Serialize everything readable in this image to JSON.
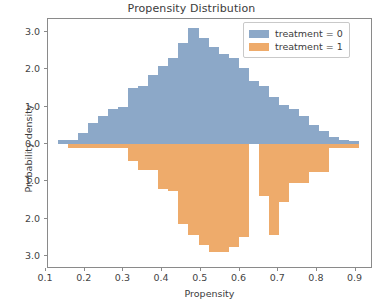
{
  "chart_data": {
    "type": "bar",
    "subtype": "mirrored-histogram",
    "title": "Propensity Distribution",
    "xlabel": "Propensity",
    "ylabel": "Probability density",
    "xlim": [
      0.105,
      0.945
    ],
    "ylim": [
      -3.35,
      3.35
    ],
    "grid": false,
    "legend_position": "upper right",
    "y_axis_note": "y tick labels show absolute values; lower half is mirrored",
    "bin_width": 0.026,
    "xticks": [
      0.1,
      0.2,
      0.3,
      0.4,
      0.5,
      0.6,
      0.7,
      0.8,
      0.9
    ],
    "xtick_labels": [
      "0.1",
      "0.2",
      "0.3",
      "0.4",
      "0.5",
      "0.6",
      "0.7",
      "0.8",
      "0.9"
    ],
    "yticks": [
      3.0,
      2.0,
      1.0,
      0.0,
      -1.0,
      -2.0,
      -3.0
    ],
    "ytick_labels": [
      "3.0",
      "2.0",
      "1.0",
      "0.0",
      "1.0",
      "2.0",
      "3.0"
    ],
    "bin_centers": [
      0.143,
      0.169,
      0.195,
      0.221,
      0.247,
      0.273,
      0.299,
      0.325,
      0.351,
      0.377,
      0.403,
      0.429,
      0.455,
      0.481,
      0.507,
      0.533,
      0.559,
      0.585,
      0.611,
      0.637,
      0.663,
      0.689,
      0.715,
      0.741,
      0.767,
      0.793,
      0.819,
      0.845,
      0.871,
      0.897
    ],
    "series": [
      {
        "name": "treatment = 0",
        "color": "#8ca8c8",
        "direction": "up",
        "values": [
          0.12,
          0.1,
          0.3,
          0.55,
          0.75,
          0.95,
          1.0,
          1.5,
          1.55,
          1.85,
          2.1,
          2.3,
          2.7,
          3.1,
          2.85,
          2.6,
          2.4,
          2.3,
          2.05,
          1.7,
          1.55,
          1.25,
          1.05,
          0.95,
          0.75,
          0.5,
          0.35,
          0.2,
          0.1,
          0.07
        ]
      },
      {
        "name": "treatment = 1",
        "color": "#eeab6b",
        "direction": "down",
        "values": [
          0.0,
          0.12,
          0.1,
          0.1,
          0.1,
          0.1,
          0.1,
          0.45,
          0.7,
          0.7,
          1.2,
          1.25,
          2.15,
          2.45,
          2.7,
          2.9,
          2.9,
          2.75,
          2.5,
          0.0,
          1.4,
          2.45,
          1.55,
          1.05,
          1.05,
          0.75,
          0.75,
          0.12,
          0.1,
          0.1
        ]
      }
    ]
  },
  "legend": {
    "items": [
      {
        "label": "treatment = 0",
        "color": "#8ca8c8"
      },
      {
        "label": "treatment = 1",
        "color": "#eeab6b"
      }
    ]
  },
  "caption_fragment": ""
}
